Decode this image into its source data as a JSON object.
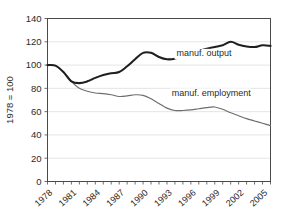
{
  "chart_data": {
    "type": "line",
    "title": "",
    "subtitle": "",
    "xlabel": "",
    "ylabel": "1978 = 100",
    "ylim": [
      0,
      140
    ],
    "xlim": [
      1978,
      2006
    ],
    "grid": true,
    "legend_position": "inline-annotation",
    "ytick_labels": [
      "0",
      "20",
      "40",
      "60",
      "80",
      "100",
      "120",
      "140"
    ],
    "ytick_values": [
      0,
      20,
      40,
      60,
      80,
      100,
      120,
      140
    ],
    "xtick_labels": [
      "1978",
      "1981",
      "1984",
      "1987",
      "1990",
      "1993",
      "1996",
      "1999",
      "2002",
      "2005"
    ],
    "xtick_values": [
      1978,
      1981,
      1984,
      1987,
      1990,
      1993,
      1996,
      1999,
      2002,
      2005
    ],
    "x": [
      1978,
      1979,
      1980,
      1981,
      1982,
      1983,
      1984,
      1985,
      1986,
      1987,
      1988,
      1989,
      1990,
      1991,
      1992,
      1993,
      1994,
      1995,
      1996,
      1997,
      1998,
      1999,
      2000,
      2001,
      2002,
      2003,
      2004,
      2005,
      2006
    ],
    "series": [
      {
        "name": "manuf. output",
        "color": "#1f1f1f",
        "label": "manuf. output",
        "values": [
          100,
          99.5,
          94,
          86,
          84.5,
          86,
          89,
          91.5,
          93,
          94,
          99,
          105,
          110.5,
          110.5,
          107,
          105,
          105.5,
          108,
          110,
          112,
          114,
          115.5,
          117,
          120,
          117.5,
          116,
          115.5,
          117,
          116.5
        ]
      },
      {
        "name": "manuf. employment",
        "color": "#6e6e6e",
        "label": "manuf. employment",
        "values": [
          100,
          99.5,
          94,
          86,
          80,
          77.5,
          76,
          75.5,
          74.5,
          73,
          73.5,
          74.5,
          74,
          71,
          67,
          63,
          61,
          61,
          61.5,
          62.5,
          63.5,
          64,
          62,
          59,
          56.5,
          54,
          52,
          50,
          48
        ]
      }
    ],
    "annotations": [
      {
        "text": "manuf. output",
        "x": 1994.2,
        "y": 107.5
      },
      {
        "text": "manuf. employment",
        "x": 1993.6,
        "y": 73.5
      }
    ]
  }
}
